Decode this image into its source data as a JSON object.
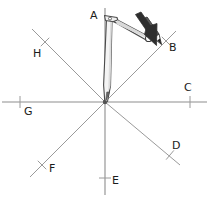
{
  "figure": {
    "width": 209,
    "height": 203,
    "background": "#ffffff"
  },
  "colors": {
    "axis_line": "#8d8d8d",
    "diagonal_line": "#9a9a9a",
    "tick": "#9a9a9a",
    "label_text": "#1b1b1b",
    "compass_outline": "#4a4a4a",
    "compass_fill": "#f2f2f2",
    "compass_shadow": "#d8d8d8",
    "pencil_dark": "#3c3c3c",
    "arrow_dark": "#2e2e2e",
    "center_dot": "#555555"
  },
  "geometry": {
    "origin": {
      "x": 105,
      "y": 102
    },
    "ray_count": 8,
    "rays": [
      {
        "id": "A",
        "label": "A",
        "angle_deg": 90,
        "end": {
          "x": 105,
          "y": 8
        },
        "tick": null,
        "label_pos": {
          "x": 90,
          "y": 10
        }
      },
      {
        "id": "B",
        "label": "B",
        "angle_deg": 45,
        "end": {
          "x": 176,
          "y": 31
        },
        "tick": {
          "x": 166,
          "y": 41
        },
        "label_pos": {
          "x": 169,
          "y": 42
        }
      },
      {
        "id": "C",
        "label": "C",
        "angle_deg": 0,
        "end": {
          "x": 207,
          "y": 102
        },
        "tick": {
          "x": 190,
          "y": 102
        },
        "label_pos": {
          "x": 184,
          "y": 82
        }
      },
      {
        "id": "D",
        "label": "D",
        "angle_deg": -45,
        "end": {
          "x": 180,
          "y": 165
        },
        "tick": {
          "x": 170,
          "y": 155
        },
        "label_pos": {
          "x": 172,
          "y": 140
        }
      },
      {
        "id": "E",
        "label": "E",
        "angle_deg": -90,
        "end": {
          "x": 105,
          "y": 195
        },
        "tick": {
          "x": 105,
          "y": 178
        },
        "label_pos": {
          "x": 112,
          "y": 175
        }
      },
      {
        "id": "F",
        "label": "F",
        "angle_deg": 225,
        "end": {
          "x": 30,
          "y": 177
        },
        "tick": {
          "x": 42,
          "y": 165
        },
        "label_pos": {
          "x": 49,
          "y": 163
        }
      },
      {
        "id": "G",
        "label": "G",
        "angle_deg": 180,
        "end": {
          "x": 2,
          "y": 102
        },
        "tick": {
          "x": 20,
          "y": 102
        },
        "label_pos": {
          "x": 24,
          "y": 106
        }
      },
      {
        "id": "H",
        "label": "H",
        "angle_deg": 135,
        "end": {
          "x": 32,
          "y": 29
        },
        "tick": {
          "x": 45,
          "y": 42
        },
        "label_pos": {
          "x": 33,
          "y": 48
        }
      }
    ]
  },
  "compass": {
    "name": "drawing-compass",
    "hinge": {
      "x": 109,
      "y": 18
    },
    "needle_tip": {
      "x": 105,
      "y": 102
    },
    "pencil_tip": {
      "x": 160,
      "y": 42
    },
    "description": "Compass with needle leg at the origin and pencil leg resting on ray B"
  },
  "arrow": {
    "name": "direction-arrow",
    "from": {
      "x": 138,
      "y": 18
    },
    "to": {
      "x": 163,
      "y": 44
    },
    "description": "Dark arrow indicating the compass pencil drawing direction"
  },
  "labels": {
    "A": "A",
    "B": "B",
    "C": "C",
    "D": "D",
    "E": "E",
    "F": "F",
    "G": "G",
    "H": "H"
  }
}
